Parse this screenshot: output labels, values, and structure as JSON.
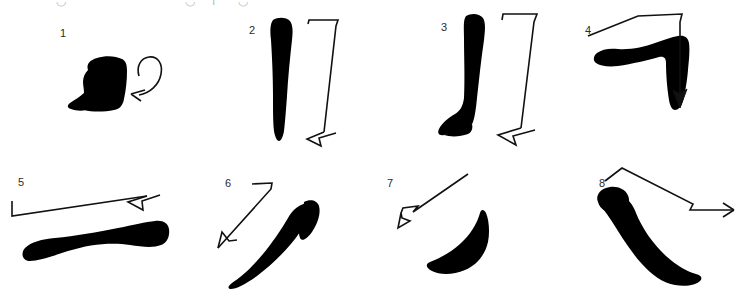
{
  "page": {
    "background_color": "#ffffff",
    "ink_color": "#000000",
    "arrow_color": "#111111",
    "label_color": "#2b2b2b",
    "width": 748,
    "height": 300
  },
  "top_crop_row": {
    "note": "Faint partially cropped glyph bottoms along the very top edge of the scan",
    "marks": [
      {
        "text": "◡",
        "x": 56,
        "y": -4
      },
      {
        "text": "◡",
        "x": 185,
        "y": -4
      },
      {
        "text": "ı",
        "x": 212,
        "y": -4
      },
      {
        "text": "◡",
        "x": 238,
        "y": -4
      }
    ]
  },
  "rows": [
    {
      "name": "top-row",
      "cells": [
        {
          "number": "1",
          "name": "stroke-1",
          "stroke_name": "dot-blob-stroke",
          "arrow_name": "curved-loop-arrow-left",
          "direction": "loop-in-from-right-to-left",
          "label_x": 60,
          "label_y": 28
        },
        {
          "number": "2",
          "name": "stroke-2",
          "stroke_name": "vertical-stroke",
          "arrow_name": "hook-down-arrow",
          "direction": "top-right-across-then-down-to-bottom-left",
          "label_x": 249,
          "label_y": 25
        },
        {
          "number": "3",
          "name": "stroke-3",
          "stroke_name": "vertical-stroke-with-foot",
          "arrow_name": "hook-down-arrow",
          "direction": "top-right-across-then-down-to-bottom-left",
          "label_x": 441,
          "label_y": 22
        },
        {
          "number": "4",
          "name": "stroke-4",
          "stroke_name": "horizontal-turn-down-stroke",
          "arrow_name": "corner-down-arrow",
          "direction": "left-to-right-then-turn-downward",
          "label_x": 585,
          "label_y": 25
        }
      ]
    },
    {
      "name": "bottom-row",
      "cells": [
        {
          "number": "5",
          "name": "stroke-5",
          "stroke_name": "horizontal-tapered-stroke",
          "arrow_name": "rightward-arrow",
          "direction": "left-to-right",
          "label_x": 18,
          "label_y": 177
        },
        {
          "number": "6",
          "name": "stroke-6",
          "stroke_name": "curved-down-left-stroke",
          "arrow_name": "diagonal-down-left-arrow",
          "direction": "upper-right-to-lower-left",
          "label_x": 225,
          "label_y": 178
        },
        {
          "number": "7",
          "name": "stroke-7",
          "stroke_name": "short-curved-sweep-stroke",
          "arrow_name": "diagonal-up-left-arrow",
          "direction": "lower-right-to-upper-left",
          "label_x": 387,
          "label_y": 178
        },
        {
          "number": "8",
          "name": "stroke-8",
          "stroke_name": "diagonal-falling-stroke",
          "arrow_name": "bent-rightward-arrow",
          "direction": "upper-left-down-then-right",
          "label_x": 599,
          "label_y": 178
        }
      ]
    }
  ]
}
